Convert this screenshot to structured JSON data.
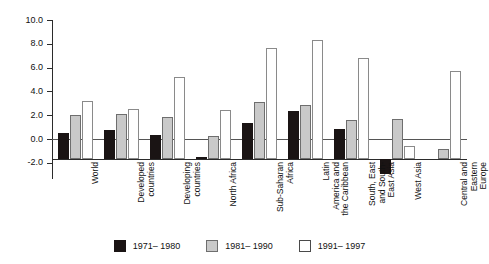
{
  "chart_data": {
    "type": "bar",
    "title": "",
    "xlabel": "",
    "ylabel": "",
    "ylim": [
      -2.0,
      10.0
    ],
    "ytick_labels": [
      "10.0",
      "8.0",
      "6.0",
      "4.0",
      "2.0",
      "0.0",
      "-2.0"
    ],
    "ytick_values": [
      10.0,
      8.0,
      6.0,
      4.0,
      2.0,
      0.0,
      -2.0
    ],
    "grid": false,
    "legend_position": "bottom",
    "categories": [
      "World",
      "Developed\ncountries",
      "Developing\ncountries",
      "North Africa",
      "Sub-Saharan\nAfrica",
      "Latin\nAmerica and\nthe Caribbean",
      "South, East\nand South-\nEast Asia",
      "West Asia",
      "Central and\nEastern\nEurope"
    ],
    "series": [
      {
        "name": "1971– 1980",
        "color": "#1a1414",
        "values": [
          2.2,
          2.4,
          2.0,
          0.1,
          3.0,
          4.0,
          2.5,
          -1.3,
          0.0
        ]
      },
      {
        "name": "1981– 1990",
        "color": "#c9c9c9",
        "values": [
          3.7,
          3.8,
          3.5,
          1.9,
          4.8,
          4.5,
          3.3,
          3.4,
          0.8
        ]
      },
      {
        "name": "1991– 1997",
        "color": "#ffffff",
        "values": [
          4.9,
          4.2,
          6.9,
          4.1,
          9.3,
          10.0,
          8.5,
          1.1,
          7.4
        ]
      }
    ]
  },
  "legend": {
    "items": [
      {
        "label": "1971– 1980"
      },
      {
        "label": "1981– 1990"
      },
      {
        "label": "1991– 1997"
      }
    ]
  }
}
